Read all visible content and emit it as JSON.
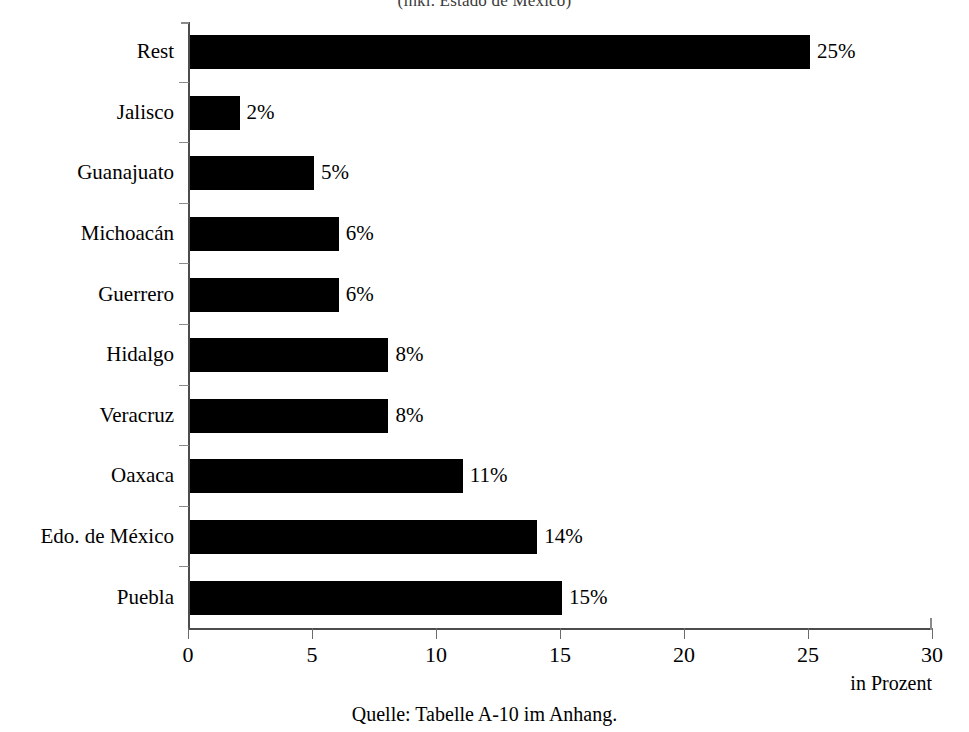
{
  "chart_data": {
    "type": "bar",
    "orientation": "horizontal",
    "title": "(inkl. Estado de México)",
    "subtitle": "",
    "xlabel": "in Prozent",
    "ylabel": "",
    "xlim": [
      0,
      30
    ],
    "xticks": [
      0,
      5,
      10,
      15,
      20,
      25,
      30
    ],
    "xticklabels": [
      "0",
      "5",
      "10",
      "15",
      "20",
      "25",
      "30"
    ],
    "grid": false,
    "legend": false,
    "bar_color": "#000000",
    "categories": [
      "Rest",
      "Jalisco",
      "Guanajuato",
      "Michoacán",
      "Guerrero",
      "Hidalgo",
      "Veracruz",
      "Oaxaca",
      "Edo. de México",
      "Puebla"
    ],
    "values": [
      25,
      2,
      5,
      6,
      6,
      8,
      8,
      11,
      14,
      15
    ],
    "data_labels": [
      "25%",
      "2%",
      "5%",
      "6%",
      "6%",
      "8%",
      "8%",
      "11%",
      "14%",
      "15%"
    ],
    "source_note": "Quelle: Tabelle A-10 im Anhang."
  },
  "footer": {
    "unit_label": "in Prozent",
    "source": "Quelle: Tabelle A-10 im Anhang."
  }
}
